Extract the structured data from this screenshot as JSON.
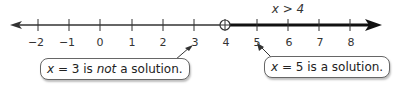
{
  "number_line": {
    "min": -2,
    "max": 8,
    "tick_labels": [
      "−2",
      "−1",
      "0",
      "1",
      "2",
      "3",
      "4",
      "5",
      "6",
      "7",
      "8"
    ],
    "open_circle_at": 4,
    "inequality_label": "x > 4",
    "shaded_direction": "right",
    "line_color": "#333333",
    "shade_color": "#111111"
  },
  "callouts": {
    "left": {
      "points_to": 3,
      "var": "x",
      "eq": " = 3 is ",
      "emph": "not",
      "rest": " a solution."
    },
    "right": {
      "points_to": 5,
      "var": "x",
      "eq": " = 5 is a solution."
    }
  }
}
